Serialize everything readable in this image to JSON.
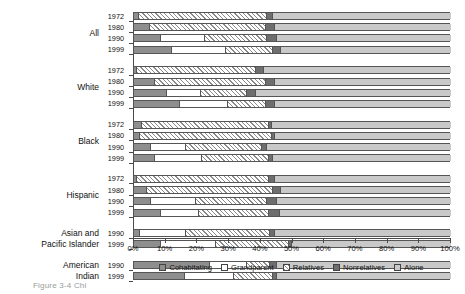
{
  "chart_data": {
    "type": "bar",
    "orientation": "horizontal",
    "stacked": true,
    "title": "",
    "xlabel": "",
    "ylabel": "",
    "xlim": [
      0,
      100
    ],
    "xticks": [
      0,
      10,
      20,
      30,
      40,
      50,
      60,
      70,
      80,
      90,
      100
    ],
    "xticklabels": [
      "0%",
      "10%",
      "20%",
      "30%",
      "40%",
      "50%",
      "60%",
      "70%",
      "80%",
      "90%",
      "100%"
    ],
    "grid": false,
    "legend_position": "bottom",
    "series": [
      {
        "name": "Cohabitating",
        "key": "cohabitating",
        "pattern": "solid-mid-gray"
      },
      {
        "name": "Grandparent",
        "key": "grandparent",
        "pattern": "white"
      },
      {
        "name": "Relatives",
        "key": "relatives",
        "pattern": "diagonal-hatch"
      },
      {
        "name": "Nonrelatives",
        "key": "nonrelatives",
        "pattern": "solid-dark-gray"
      },
      {
        "name": "Alone",
        "key": "alone",
        "pattern": "solid-light-gray"
      }
    ],
    "groups": [
      {
        "label": "All",
        "label_lines": [
          "All"
        ],
        "rows": [
          {
            "year": "1972",
            "values": [
              1.5,
              0.0,
              40.5,
              2.0,
              56.0
            ]
          },
          {
            "year": "1980",
            "values": [
              5.0,
              0.0,
              36.5,
              3.0,
              55.5
            ]
          },
          {
            "year": "1990",
            "values": [
              8.5,
              14.0,
              19.5,
              3.0,
              55.0
            ]
          },
          {
            "year": "1999",
            "values": [
              12.0,
              17.0,
              15.0,
              2.5,
              53.5
            ]
          }
        ]
      },
      {
        "label": "White",
        "label_lines": [
          "White"
        ],
        "rows": [
          {
            "year": "1972",
            "values": [
              1.0,
              0.0,
              37.5,
              2.5,
              59.0
            ]
          },
          {
            "year": "1980",
            "values": [
              6.5,
              0.0,
              35.0,
              3.0,
              55.5
            ]
          },
          {
            "year": "1990",
            "values": [
              10.5,
              10.5,
              14.5,
              3.0,
              61.5
            ]
          },
          {
            "year": "1999",
            "values": [
              14.5,
              15.0,
              12.0,
              3.0,
              55.5
            ]
          }
        ]
      },
      {
        "label": "Black",
        "label_lines": [
          "Black"
        ],
        "rows": [
          {
            "year": "1972",
            "values": [
              2.5,
              0.0,
              40.0,
              1.0,
              56.5
            ]
          },
          {
            "year": "1980",
            "values": [
              2.0,
              0.0,
              41.5,
              1.0,
              55.5
            ]
          },
          {
            "year": "1990",
            "values": [
              5.5,
              11.0,
              24.0,
              1.5,
              58.0
            ]
          },
          {
            "year": "1999",
            "values": [
              6.5,
              15.0,
              21.0,
              1.5,
              56.0
            ]
          }
        ]
      },
      {
        "label": "Hispanic",
        "label_lines": [
          "Hispanic"
        ],
        "rows": [
          {
            "year": "1972",
            "values": [
              1.0,
              0.0,
              41.5,
              2.0,
              55.5
            ]
          },
          {
            "year": "1980",
            "values": [
              4.0,
              0.0,
              40.0,
              2.5,
              53.5
            ]
          },
          {
            "year": "1990",
            "values": [
              5.5,
              14.0,
              22.5,
              3.0,
              55.0
            ]
          },
          {
            "year": "1999",
            "values": [
              8.5,
              12.0,
              22.0,
              3.5,
              54.0
            ]
          }
        ]
      },
      {
        "label": "Asian and Pacific Islander",
        "label_lines": [
          "Asian and",
          "Pacific Islander"
        ],
        "rows": [
          {
            "year": "1990",
            "values": [
              2.0,
              14.5,
              26.5,
              1.5,
              55.5
            ]
          },
          {
            "year": "1999",
            "values": [
              8.5,
              17.5,
              23.0,
              0.8,
              50.2
            ]
          }
        ]
      },
      {
        "label": "American Indian",
        "label_lines": [
          "American",
          "Indian"
        ],
        "rows": [
          {
            "year": "1990",
            "values": [
              24.0,
              11.5,
              7.5,
              2.0,
              55.0
            ]
          },
          {
            "year": "1999",
            "values": [
              16.0,
              15.5,
              12.5,
              1.0,
              55.0
            ]
          }
        ]
      }
    ]
  },
  "legend": {
    "items": [
      {
        "label": "Cohabitating"
      },
      {
        "label": "Grandparent"
      },
      {
        "label": "Relatives"
      },
      {
        "label": "Nonrelatives"
      },
      {
        "label": "Alone"
      }
    ]
  },
  "caption": {
    "text": "Figure 3-4  Chi"
  }
}
